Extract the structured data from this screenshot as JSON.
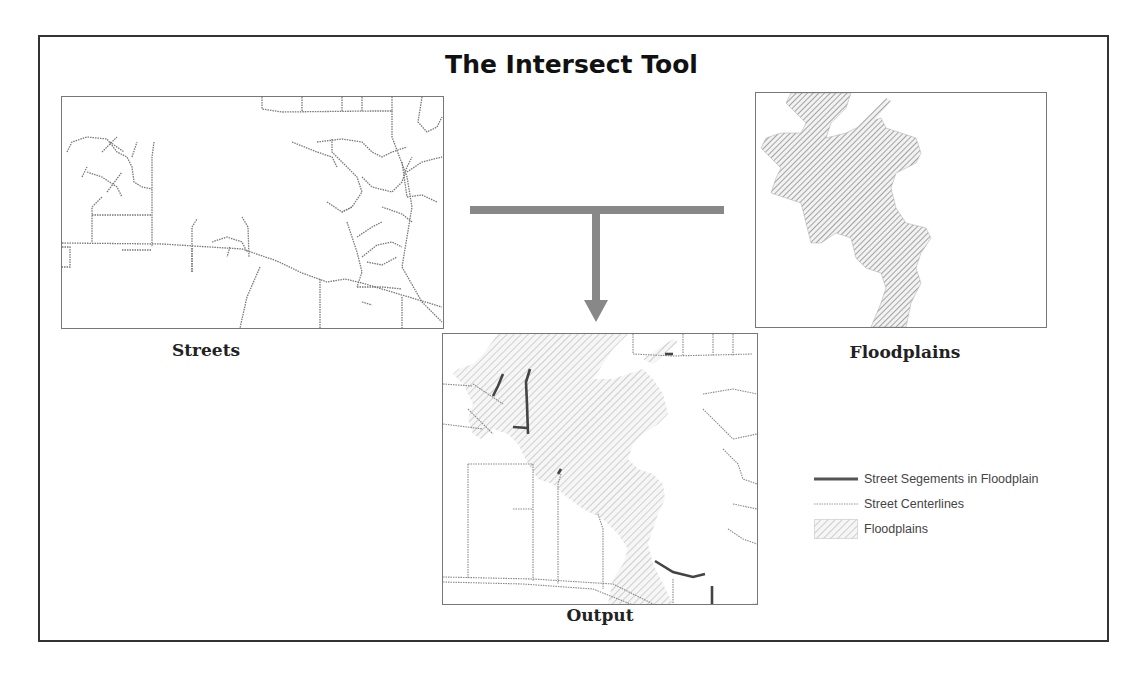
{
  "title": "The Intersect Tool",
  "panels": {
    "streets": {
      "label": "Streets"
    },
    "floodplains": {
      "label": "Floodplains"
    },
    "output": {
      "label": "Output"
    }
  },
  "legend": {
    "items": [
      {
        "label": "Street Segements in Floodplain",
        "symbol": "thick-dark-line"
      },
      {
        "label": "Street Centerlines",
        "symbol": "dotted-thin-line"
      },
      {
        "label": "Floodplains",
        "symbol": "hatched-box"
      }
    ]
  },
  "colors": {
    "frame": "#333333",
    "street": "#777777",
    "street_highlight": "#444444",
    "hatch": "#9a9a9a",
    "arrow": "#888888"
  }
}
